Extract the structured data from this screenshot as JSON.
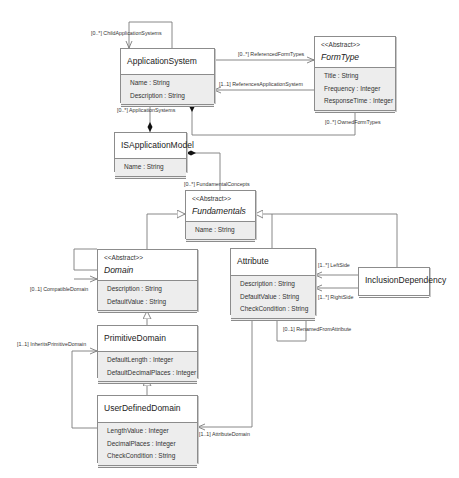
{
  "diagram": {
    "type": "UML class diagram",
    "classes": [
      {
        "id": "application_system",
        "name": "ApplicationSystem",
        "abstract": false,
        "stereotype": "",
        "attributes": [
          "Name : String",
          "Description : String"
        ]
      },
      {
        "id": "form_type",
        "name": "FormType",
        "abstract": true,
        "stereotype": "<<Abstract>>",
        "attributes": [
          "Title : String",
          "Frequency : Integer",
          "ResponseTime : Integer"
        ]
      },
      {
        "id": "is_application_model",
        "name": "ISApplicationModel",
        "abstract": false,
        "stereotype": "",
        "attributes": [
          "Name : String"
        ]
      },
      {
        "id": "fundamentals",
        "name": "Fundamentals",
        "abstract": true,
        "stereotype": "<<Abstract>>",
        "attributes": [
          "Name : String"
        ]
      },
      {
        "id": "domain",
        "name": "Domain",
        "abstract": true,
        "stereotype": "<<Abstract>>",
        "attributes": [
          "Description : String",
          "DefaultValue : String"
        ]
      },
      {
        "id": "attribute",
        "name": "Attribute",
        "abstract": false,
        "stereotype": "",
        "attributes": [
          "Description : String",
          "DefaultValue : String",
          "CheckCondition : String"
        ]
      },
      {
        "id": "inclusion_dependency",
        "name": "InclusionDependency",
        "abstract": false,
        "stereotype": "",
        "attributes": []
      },
      {
        "id": "primitive_domain",
        "name": "PrimitiveDomain",
        "abstract": false,
        "stereotype": "",
        "attributes": [
          "DefaultLength : Integer",
          "DefaultDecimalPlaces : Integer"
        ]
      },
      {
        "id": "user_defined_domain",
        "name": "UserDefinedDomain",
        "abstract": false,
        "stereotype": "",
        "attributes": [
          "LengthValue : Integer",
          "DecimalPlaces : Integer",
          "CheckCondition : String"
        ]
      }
    ],
    "associations": [
      {
        "label": "[0..*] ChildApplicationSystems",
        "from": "ApplicationSystem",
        "to": "ApplicationSystem",
        "kind": "self-association"
      },
      {
        "label": "[0..*] ReferencedFormTypes",
        "from": "ApplicationSystem",
        "to": "FormType",
        "kind": "association"
      },
      {
        "label": "[1..1] ReferencesApplicationSystem",
        "from": "FormType",
        "to": "ApplicationSystem",
        "kind": "association"
      },
      {
        "label": "[0..*] OwnedFormTypes",
        "from": "ApplicationSystem",
        "to": "FormType",
        "kind": "composition"
      },
      {
        "label": "[0..*] ApplicationSystems",
        "from": "ISApplicationModel",
        "to": "ApplicationSystem",
        "kind": "composition"
      },
      {
        "label": "[0..*] FundamentalConcepts",
        "from": "ISApplicationModel",
        "to": "Fundamentals",
        "kind": "composition"
      },
      {
        "label": "[0..1] CompatibleDomain",
        "from": "Domain",
        "to": "Domain",
        "kind": "self-association"
      },
      {
        "label": "[1..*] LeftSide",
        "from": "InclusionDependency",
        "to": "Attribute",
        "kind": "association"
      },
      {
        "label": "[1..*] RightSide",
        "from": "InclusionDependency",
        "to": "Attribute",
        "kind": "association"
      },
      {
        "label": "[0..1] RenamedFromAttribute",
        "from": "Attribute",
        "to": "Attribute",
        "kind": "self-association"
      },
      {
        "label": "[1..1] InheritsPrimitiveDomain",
        "from": "UserDefinedDomain",
        "to": "PrimitiveDomain",
        "kind": "association"
      },
      {
        "label": "[1..1] AttributeDomain",
        "from": "Attribute",
        "to": "UserDefinedDomain",
        "kind": "association"
      }
    ],
    "generalizations": [
      {
        "child": "Domain",
        "parent": "Fundamentals"
      },
      {
        "child": "Attribute",
        "parent": "Fundamentals"
      },
      {
        "child": "InclusionDependency",
        "parent": "Fundamentals"
      },
      {
        "child": "PrimitiveDomain",
        "parent": "Domain"
      },
      {
        "child": "UserDefinedDomain",
        "parent": "PrimitiveDomain"
      }
    ],
    "colors": {
      "border": "#8c8c8c",
      "attr_bg": "#ededed",
      "line": "#7a7a7a",
      "text": "#222222"
    }
  },
  "labels": {
    "child_application_systems": "[0..*] ChildApplicationSystems",
    "referenced_form_types": "[0..*] ReferencedFormTypes",
    "references_application_system": "[1..1] ReferencesApplicationSystem",
    "application_systems": "[0..*] ApplicationSystems",
    "owned_form_types": "[0..*] OwnedFormTypes",
    "fundamental_concepts": "[0..*] FundamentalConcepts",
    "compatible_domain": "[0..1] CompatibleDomain",
    "left_side": "[1..*] LeftSide",
    "right_side": "[1..*] RightSide",
    "renamed_from_attribute": "[0..1] RenamedFromAttribute",
    "inherits_primitive_domain": "[1..1] InheritsPrimitiveDomain",
    "attribute_domain": "[1..1] AttributeDomain"
  }
}
